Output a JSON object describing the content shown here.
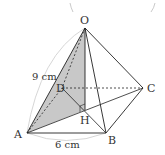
{
  "figure": {
    "type": "square pyramid",
    "vertices": {
      "O": "O",
      "A": "A",
      "B": "B",
      "C": "C",
      "D": "D",
      "H": "H"
    },
    "dimensions": {
      "edge_OA": "9 cm",
      "edge_AB": "6 cm"
    },
    "shaded_region": "triangle OAH",
    "colors": {
      "line": "#222222",
      "shade": "#c8c8c8",
      "arc": "#cccccc"
    }
  }
}
